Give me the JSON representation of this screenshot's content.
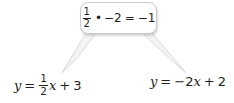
{
  "figure": {
    "type": "math-callout-diagram",
    "background_color": "#ffffff",
    "text_color": "#231f20",
    "callout": {
      "border_color": "#c9c9c9",
      "fill_color": "#ffffff",
      "expression_text": "1/2 • -2 = -1",
      "parts": {
        "fraction_numerator": "1",
        "fraction_denominator": "2",
        "multiply_symbol": "•",
        "factor": "−2",
        "equals": "=",
        "result": "−1"
      }
    },
    "equations": {
      "left": {
        "text": "y = 1/2 x + 3",
        "parts": {
          "y": "y",
          "equals": "=",
          "fraction_numerator": "1",
          "fraction_denominator": "2",
          "variable": "x",
          "plus": "+",
          "constant": "3"
        }
      },
      "right": {
        "text": "y = -2x + 2",
        "parts": {
          "y": "y",
          "equals": "=",
          "coefficient": "−2",
          "variable": "x",
          "plus": "+",
          "constant": "2"
        }
      }
    },
    "connectors": {
      "stroke_color": "#d0d0d0",
      "fill_color": "#f2f2f2",
      "left_tail_label": "pointer-to-left-equation",
      "right_tail_label": "pointer-to-right-equation"
    }
  }
}
